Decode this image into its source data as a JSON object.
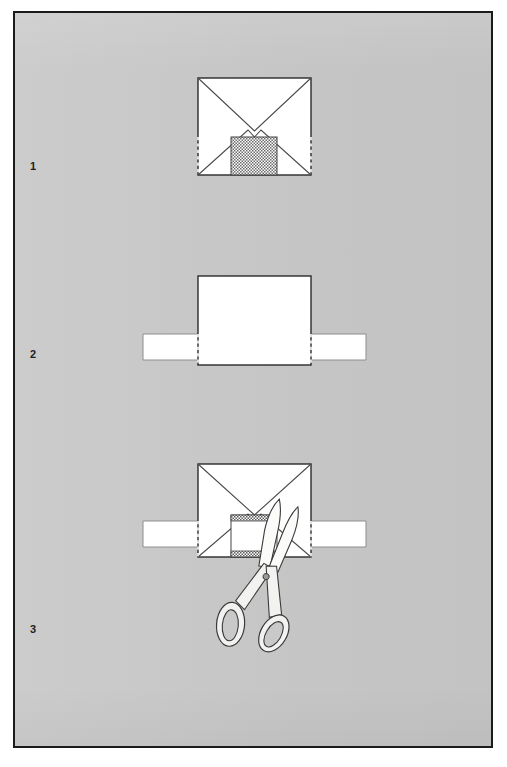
{
  "figure": {
    "background_color": "#c9c9c9",
    "page_color": "#ffffff",
    "frame_color": "#1b1b1b",
    "paper_color": "#ffffff",
    "ink_color": "#3c3c3c"
  },
  "steps": [
    {
      "number": "1",
      "caption": "",
      "name": "envelope-with-hatched-patch",
      "envelope": {
        "x": 198,
        "y": 78,
        "width": 113,
        "height": 97
      },
      "hatched_patch": {
        "x": 231,
        "y": 137,
        "width": 46,
        "height": 38,
        "pattern": "checker"
      }
    },
    {
      "number": "2",
      "caption": "",
      "name": "paper-square-over-band",
      "paper": {
        "x": 198,
        "y": 276,
        "width": 113,
        "height": 89
      },
      "band": {
        "x": 143,
        "y": 334,
        "width": 223,
        "height": 26
      }
    },
    {
      "number": "3",
      "caption": "",
      "name": "envelope-band-and-scissors",
      "envelope": {
        "x": 198,
        "y": 464,
        "width": 113,
        "height": 93
      },
      "band": {
        "x": 143,
        "y": 521,
        "width": 223,
        "height": 26
      },
      "cut_window": {
        "x": 231,
        "y": 515,
        "width": 46,
        "height": 42
      },
      "scissors": {
        "x": 236,
        "y": 520,
        "width": 72,
        "height": 125,
        "rotation_deg": 18
      }
    }
  ],
  "labels": {
    "step1": "1",
    "step2": "2",
    "step3": "3"
  }
}
